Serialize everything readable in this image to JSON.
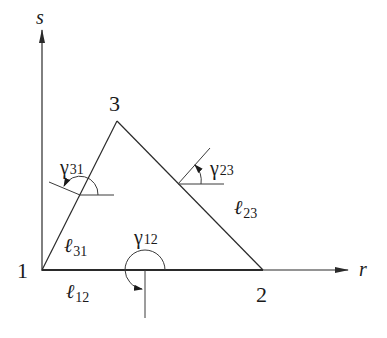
{
  "figure": {
    "type": "triangle-element-with-normals",
    "axes": {
      "vertical_label": "s",
      "horizontal_label": "r"
    },
    "nodes": [
      {
        "id": "1",
        "label": "1"
      },
      {
        "id": "2",
        "label": "2"
      },
      {
        "id": "3",
        "label": "3"
      }
    ],
    "angles": [
      {
        "id": "gamma31",
        "symbol": "γ",
        "subscript": "31"
      },
      {
        "id": "gamma23",
        "symbol": "γ",
        "subscript": "23"
      },
      {
        "id": "gamma12",
        "symbol": "γ",
        "subscript": "12"
      }
    ],
    "edge_lengths": [
      {
        "id": "l31",
        "symbol": "ℓ",
        "subscript": "31"
      },
      {
        "id": "l12",
        "symbol": "ℓ",
        "subscript": "12"
      },
      {
        "id": "l23",
        "symbol": "ℓ",
        "subscript": "23"
      }
    ],
    "colors": {
      "ink": "#1a1a1a",
      "background": "#ffffff"
    }
  }
}
